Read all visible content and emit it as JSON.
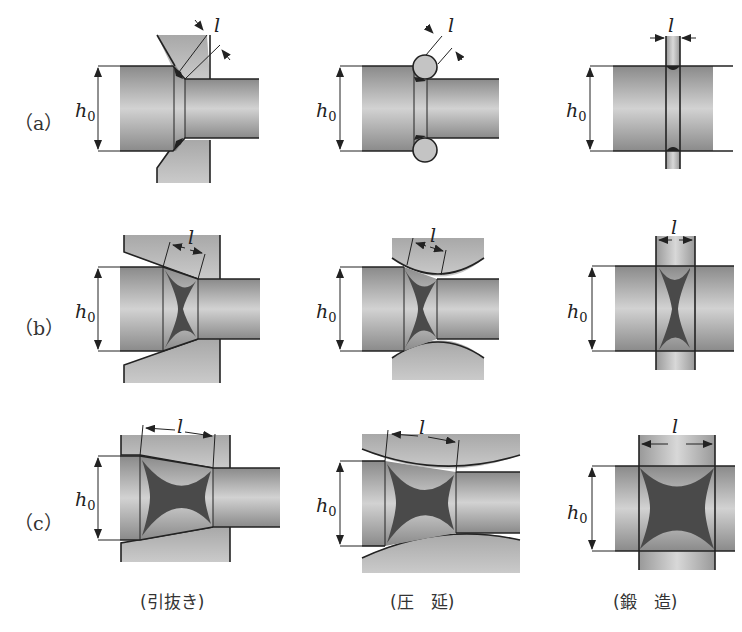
{
  "figure": {
    "row_labels": [
      "（a）",
      "（b）",
      "（c）"
    ],
    "column_captions": [
      "(引抜き)",
      "(圧　延)",
      "(鍛　造)"
    ],
    "dimension_labels": {
      "height": "h",
      "height_subscript": "0",
      "length": "l"
    },
    "processes": [
      {
        "name": "引抜き",
        "tool": "die"
      },
      {
        "name": "圧延",
        "tool": "rolls"
      },
      {
        "name": "鍛造",
        "tool": "flat anvils"
      }
    ],
    "rows": [
      {
        "id": "a",
        "description": "small contact length l"
      },
      {
        "id": "b",
        "description": "medium contact length l"
      },
      {
        "id": "c",
        "description": "large contact length l"
      }
    ],
    "colors": {
      "workpiece_dark": "#8a8a8a",
      "workpiece_light": "#cfcfcf",
      "tool": "#b8b8b8",
      "deformation_zone": "#4a4a4a",
      "outline": "#222222"
    }
  }
}
